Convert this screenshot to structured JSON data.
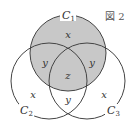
{
  "figure": {
    "label": "図 2",
    "circles": {
      "c1": {
        "name": "C",
        "sub": "1",
        "cx": 68,
        "cy": 53,
        "r": 38
      },
      "c2": {
        "name": "C",
        "sub": "2",
        "cx": 49,
        "cy": 81,
        "r": 38
      },
      "c3": {
        "name": "C",
        "sub": "3",
        "cx": 87,
        "cy": 81,
        "r": 38
      }
    },
    "regions": {
      "c1_only": "x",
      "c1_c2": "y",
      "c1_c3": "y",
      "all_three": "z",
      "c2_only": "x",
      "c2_c3": "y",
      "c3_only": "x"
    },
    "colors": {
      "shade": "#c8c8c8",
      "stroke": "#444444",
      "background": "#ffffff"
    }
  }
}
